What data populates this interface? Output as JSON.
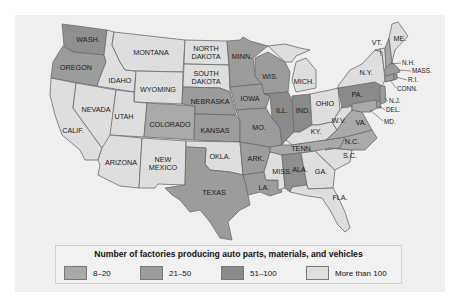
{
  "legend": {
    "title": "Number of factories producing auto parts, materials, and vehicles",
    "items": [
      {
        "label": "8–20",
        "color": "#a9a9a9"
      },
      {
        "label": "21–50",
        "color": "#9c9c9c"
      },
      {
        "label": "51–100",
        "color": "#8a8a8a"
      },
      {
        "label": "More than 100",
        "color": "#dedede"
      }
    ]
  },
  "colors": {
    "panel": "#efefef",
    "c1": "#a9a9a9",
    "c2": "#9c9c9c",
    "c3": "#8a8a8a",
    "c4": "#dedede"
  },
  "states": {
    "wash": "WASH.",
    "oregon": "OREGON",
    "calif": "CALIF.",
    "idaho": "IDAHO",
    "nevada": "NEVADA",
    "montana": "MONTANA",
    "wyoming": "WYOMING",
    "utah": "UTAH",
    "arizona": "ARIZONA",
    "colorado": "COLORADO",
    "new": "NEW",
    "mexico": "MEXICO",
    "north": "NORTH",
    "dakota1": "DAKOTA",
    "south": "SOUTH",
    "dakota2": "DAKOTA",
    "nebraska": "NEBRASKA",
    "kansas": "KANSAS",
    "okla": "OKLA.",
    "texas": "TEXAS",
    "minn": "MINN.",
    "iowa": "IOWA",
    "mo": "MO.",
    "ark": "ARK.",
    "la": "LA.",
    "wis": "WIS.",
    "ill": "ILL.",
    "mich": "MICH.",
    "ind": "IND.",
    "ohio": "OHIO",
    "ky": "KY.",
    "tenn": "TENN.",
    "miss": "MISS.",
    "ala": "ALA.",
    "ga": "GA.",
    "fla": "FLA.",
    "sc": "S.C.",
    "nc": "N.C.",
    "va": "VA.",
    "wv": "W.V.",
    "pa": "PA.",
    "ny": "N.Y.",
    "vt": "VT.",
    "me": "ME.",
    "nh": "N.H.",
    "mass": "MASS.",
    "ri": "R.I.",
    "conn": "CONN.",
    "nj": "N.J.",
    "del": "DEL.",
    "md": "MD."
  }
}
